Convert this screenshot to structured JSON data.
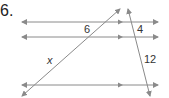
{
  "problem": {
    "number": "6.",
    "labels": {
      "segment_top_diagonal": "6",
      "segment_x": "x",
      "segment_top_transversal": "4",
      "segment_bottom_transversal": "12"
    },
    "colors": {
      "line": "#8a8a8a",
      "text": "#333333"
    }
  }
}
